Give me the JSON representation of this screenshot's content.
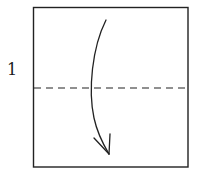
{
  "diagram": {
    "type": "origami-instruction",
    "step": {
      "number": "1"
    },
    "paper": {
      "shape": "square",
      "x": 33,
      "y": 7,
      "width": 155,
      "height": 160,
      "stroke": "#222222"
    },
    "fold_line": {
      "style": "valley-fold-dashed",
      "orientation": "horizontal",
      "y": 88,
      "stroke": "#222222"
    },
    "fold_arrow": {
      "direction": "down",
      "meaning": "fold top half down to bottom edge",
      "stroke": "#222222"
    }
  }
}
